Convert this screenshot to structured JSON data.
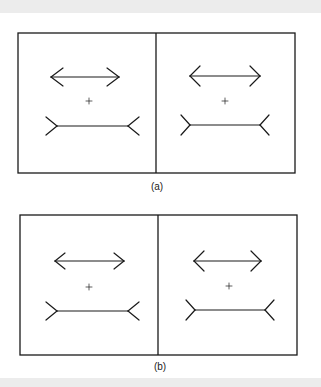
{
  "figure": {
    "colors": {
      "ink": "#1a1a1a",
      "background": "#ffffff",
      "band": "#ececec"
    },
    "panels": [
      {
        "caption": "(a)",
        "caption_pos": {
          "x": 157,
          "y": 181
        },
        "box": {
          "x1": 18,
          "y1": 33,
          "x2": 295,
          "y2": 173,
          "divider_x": 156
        },
        "halves": [
          {
            "arrows_in": {
              "x1": 51,
              "x2": 119,
              "y": 77,
              "wing_dx": 12,
              "wing_dy": 9
            },
            "fixation_cross": {
              "x": 89,
              "y": 101,
              "size": 3
            },
            "arrows_out": {
              "x1": 57,
              "x2": 128,
              "y": 126,
              "fin_dx": 11,
              "fin_dy": 9
            }
          },
          {
            "arrows_in": {
              "x1": 190,
              "x2": 260,
              "y": 76,
              "wing_dx": 10,
              "wing_dy": 10
            },
            "fixation_cross": {
              "x": 225,
              "y": 101,
              "size": 3
            },
            "arrows_out": {
              "x1": 190,
              "x2": 260,
              "y": 125,
              "fin_dx": 9,
              "fin_dy": 10
            }
          }
        ]
      },
      {
        "caption": "(b)",
        "caption_pos": {
          "x": 160,
          "y": 361
        },
        "box": {
          "x1": 20,
          "y1": 215,
          "x2": 297,
          "y2": 355,
          "divider_x": 158
        },
        "halves": [
          {
            "arrows_in": {
              "x1": 55,
              "x2": 124,
              "y": 261,
              "wing_dx": 10,
              "wing_dy": 8
            },
            "fixation_cross": {
              "x": 89,
              "y": 287,
              "size": 3
            },
            "arrows_out": {
              "x1": 57,
              "x2": 128,
              "y": 311,
              "fin_dx": 11,
              "fin_dy": 9
            }
          },
          {
            "arrows_in": {
              "x1": 194,
              "x2": 261,
              "y": 261,
              "wing_dx": 10,
              "wing_dy": 10
            },
            "fixation_cross": {
              "x": 229,
              "y": 286,
              "size": 3
            },
            "arrows_out": {
              "x1": 195,
              "x2": 265,
              "y": 310,
              "fin_dx": 9,
              "fin_dy": 10
            }
          }
        ]
      }
    ]
  }
}
